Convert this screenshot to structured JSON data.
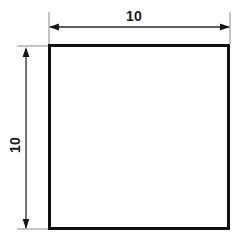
{
  "drawing": {
    "title": "Square profile dimensioned drawing",
    "units_implied": "mm",
    "background_color": "#ffffff",
    "outline_color": "#111111",
    "dimension_line_color": "#2b2b2b",
    "extension_line_color": "#8a8a8a",
    "shape": {
      "name": "square",
      "fill_color": "#ffffff",
      "stroke_color": "#111111",
      "stroke_width_px": 3,
      "x": 49.5,
      "y": 45.5,
      "width": 179,
      "height": 183
    },
    "dimensions": [
      {
        "id": "width-dimension",
        "label": "10",
        "orientation": "horizontal",
        "value": 10,
        "line_y": 27,
        "line_x_start": 49,
        "line_x_end": 230,
        "text_x": 134,
        "text_y": 21,
        "extension_lines": [
          {
            "x": 49,
            "y_start": 12,
            "y_end": 44
          },
          {
            "x": 230,
            "y_start": 12,
            "y_end": 44
          }
        ]
      },
      {
        "id": "height-dimension",
        "label": "10",
        "orientation": "vertical",
        "value": 10,
        "line_x": 26,
        "line_y_start": 48,
        "line_y_end": 229,
        "text_x": 20,
        "text_y": 145,
        "extension_lines": [
          {
            "y": 46,
            "x_start": 17,
            "x_end": 49
          },
          {
            "y": 229,
            "x_start": 17,
            "x_end": 49
          }
        ]
      }
    ],
    "arrowheads": {
      "style": "solid-filled-triangle",
      "length_px": 9,
      "half_width_px": 3
    }
  }
}
